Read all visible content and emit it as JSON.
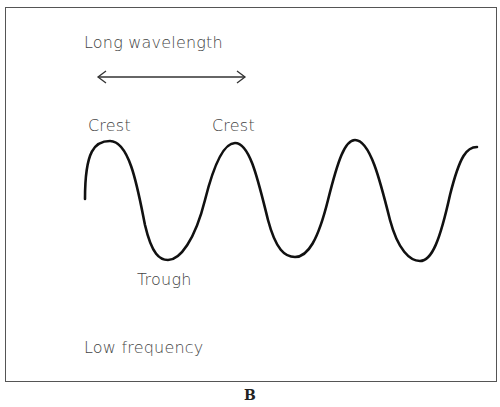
{
  "diagram": {
    "labels": {
      "wavelength": "Long wavelength",
      "crest1": "Crest",
      "crest2": "Crest",
      "trough": "Trough",
      "frequency": "Low frequency"
    },
    "caption": "B",
    "colors": {
      "wave": "#111111",
      "text": "#444444",
      "border": "#555555"
    }
  }
}
